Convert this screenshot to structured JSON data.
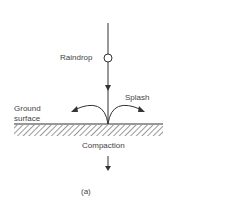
{
  "diagram": {
    "labels": {
      "raindrop": "Raindrop",
      "splash": "Splash",
      "ground_line1": "Ground",
      "ground_line2": "surface",
      "compaction": "Compaction",
      "caption": "(a)"
    },
    "colors": {
      "line": "#333333",
      "text": "#444444",
      "background": "#ffffff"
    }
  }
}
